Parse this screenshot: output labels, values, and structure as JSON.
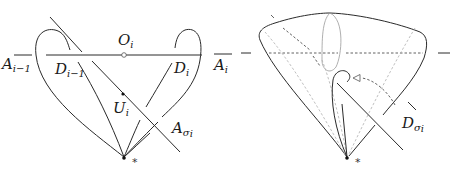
{
  "figure": {
    "left_panel": {
      "labels": {
        "A_prev": {
          "main": "A",
          "sub": "i−1"
        },
        "D_prev": {
          "main": "D",
          "sub": "i−1"
        },
        "O": {
          "main": "O",
          "sub": "i"
        },
        "D": {
          "main": "D",
          "sub": "i"
        },
        "A": {
          "main": "A",
          "sub": "i"
        },
        "U": {
          "main": "U",
          "sub": "i"
        },
        "A_sigma": {
          "main": "A",
          "sub": "σ",
          "subsub": "i"
        },
        "basepoint": "*"
      }
    },
    "right_panel": {
      "labels": {
        "D_sigma": {
          "main": "D",
          "sub": "σ",
          "subsub": "i"
        },
        "basepoint": "*"
      },
      "arrow": "hollow-triangle-arrowhead"
    }
  }
}
